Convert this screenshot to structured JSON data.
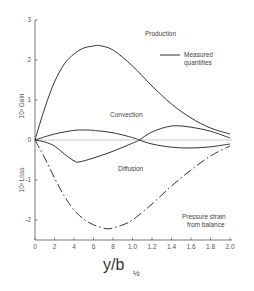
{
  "chart_data": {
    "type": "line",
    "title": "",
    "xlabel": "y/b½",
    "ylabel_upper": "10³ Gain",
    "ylabel_lower": "10³ Loss",
    "xlim": [
      0,
      2.0
    ],
    "ylim": [
      -2.5,
      3
    ],
    "x_ticks": [
      "0",
      "2",
      "4",
      "6",
      "8",
      "1.0",
      "1.2",
      "1.4",
      "1.6",
      "1.8",
      "2.0"
    ],
    "y_ticks": [
      "3",
      "2",
      "1",
      "0",
      "-1",
      "-2"
    ],
    "grid": false,
    "legend": {
      "entry": "Measured quantities",
      "style": "solid",
      "position": "upper right"
    },
    "series": [
      {
        "name": "Production",
        "style": "solid",
        "x": [
          0,
          0.1,
          0.2,
          0.3,
          0.4,
          0.5,
          0.6,
          0.66,
          0.8,
          1.0,
          1.2,
          1.4,
          1.6,
          1.8,
          2.0
        ],
        "y": [
          0,
          0.8,
          1.45,
          1.9,
          2.15,
          2.3,
          2.35,
          2.36,
          2.25,
          1.85,
          1.35,
          0.9,
          0.55,
          0.3,
          0.15
        ]
      },
      {
        "name": "Convection",
        "style": "solid",
        "x": [
          0,
          0.2,
          0.4,
          0.5,
          0.6,
          0.8,
          1.0,
          1.07,
          1.2,
          1.4,
          1.6,
          1.8,
          2.0
        ],
        "y": [
          0,
          0.15,
          0.24,
          0.25,
          0.24,
          0.18,
          0.06,
          0,
          -0.1,
          -0.18,
          -0.2,
          -0.17,
          -0.1
        ]
      },
      {
        "name": "Diffusion",
        "style": "solid",
        "x": [
          0,
          0.1,
          0.2,
          0.3,
          0.4,
          0.45,
          0.6,
          0.8,
          1.0,
          1.07,
          1.2,
          1.4,
          1.6,
          1.8,
          2.0
        ],
        "y": [
          0,
          -0.05,
          -0.15,
          -0.35,
          -0.52,
          -0.55,
          -0.45,
          -0.28,
          -0.08,
          0,
          0.2,
          0.35,
          0.32,
          0.22,
          0.05
        ]
      },
      {
        "name": "Pressure strain from balance",
        "style": "dash-dot",
        "x": [
          0,
          0.1,
          0.2,
          0.3,
          0.4,
          0.5,
          0.6,
          0.7,
          0.75,
          0.8,
          0.9,
          1.0,
          1.2,
          1.4,
          1.6,
          1.8,
          2.0
        ],
        "y": [
          0,
          -0.45,
          -0.95,
          -1.4,
          -1.75,
          -1.98,
          -2.12,
          -2.2,
          -2.22,
          -2.2,
          -2.12,
          -2.0,
          -1.6,
          -1.15,
          -0.75,
          -0.4,
          -0.15
        ]
      }
    ],
    "annotations": [
      {
        "text": "Production",
        "x": 1.12,
        "y": 2.65
      },
      {
        "text": "Convection",
        "x": 0.83,
        "y": 0.6
      },
      {
        "text": "Diffusion",
        "x": 1.0,
        "y": -0.85
      },
      {
        "text": "Pressure strain",
        "x": 1.55,
        "y": -1.9
      },
      {
        "text": "from balance",
        "x": 1.6,
        "y": -2.15
      }
    ]
  },
  "labels": {
    "production": "Production",
    "convection": "Convection",
    "diffusion": "Diffusion",
    "pressure_line1": "Pressure strain",
    "pressure_line2": "from balance",
    "legend_line1": "Measured",
    "legend_line2": "quantities",
    "ylabel_upper": "10³ Gain",
    "ylabel_lower": "10³ Loss",
    "xlabel_main": "y/b",
    "xlabel_sub": "½"
  }
}
